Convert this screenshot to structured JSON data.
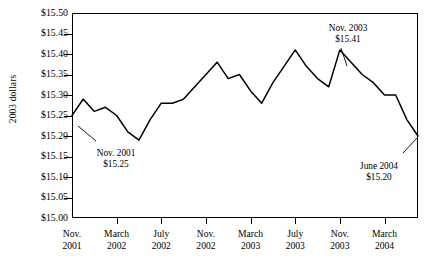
{
  "chart_data": {
    "type": "line",
    "title": "",
    "xlabel": "",
    "ylabel": "2003 dollars",
    "ylim": [
      15.0,
      15.5
    ],
    "ytick_step": 0.05,
    "grid": false,
    "legend": "none",
    "y_ticks": [
      "$15.50",
      "$15.45",
      "$15.40",
      "$15.35",
      "$15.30",
      "$15.25",
      "$15.20",
      "$15.15",
      "$15.10",
      "$15.05",
      "$15.00"
    ],
    "x_ticks": [
      {
        "line1": "Nov.",
        "line2": "2001"
      },
      {
        "line1": "March",
        "line2": "2002"
      },
      {
        "line1": "July",
        "line2": "2002"
      },
      {
        "line1": "Nov.",
        "line2": "2002"
      },
      {
        "line1": "March",
        "line2": "2003"
      },
      {
        "line1": "July",
        "line2": "2003"
      },
      {
        "line1": "Nov.",
        "line2": "2003"
      },
      {
        "line1": "March",
        "line2": "2004"
      }
    ],
    "x": [
      "Nov. 2001",
      "Dec. 2001",
      "Jan. 2002",
      "Feb. 2002",
      "March 2002",
      "April 2002",
      "May 2002",
      "June 2002",
      "July 2002",
      "Aug. 2002",
      "Sept. 2002",
      "Oct. 2002",
      "Nov. 2002",
      "Dec. 2002",
      "Jan. 2003",
      "Feb. 2003",
      "March 2003",
      "April 2003",
      "May 2003",
      "June 2003",
      "July 2003",
      "Aug. 2003",
      "Sept. 2003",
      "Oct. 2003",
      "Nov. 2003",
      "Dec. 2003",
      "Jan. 2004",
      "Feb. 2004",
      "March 2004",
      "April 2004",
      "May 2004",
      "June 2004"
    ],
    "values": [
      15.25,
      15.29,
      15.26,
      15.27,
      15.25,
      15.21,
      15.19,
      15.24,
      15.28,
      15.28,
      15.29,
      15.32,
      15.35,
      15.38,
      15.34,
      15.35,
      15.31,
      15.28,
      15.33,
      15.37,
      15.41,
      15.37,
      15.34,
      15.32,
      15.41,
      15.38,
      15.35,
      15.33,
      15.3,
      15.3,
      15.24,
      15.2
    ],
    "annotations": [
      {
        "name": "nov-2001",
        "label_line1": "Nov. 2001",
        "label_line2": "$15.25",
        "x": "Nov. 2001",
        "y": 15.25
      },
      {
        "name": "nov-2003",
        "label_line1": "Nov. 2003",
        "label_line2": "$15.41",
        "x": "Nov. 2003",
        "y": 15.41
      },
      {
        "name": "june-2004",
        "label_line1": "June 2004",
        "label_line2": "$15.20",
        "x": "June 2004",
        "y": 15.2
      }
    ],
    "colors": {
      "line": "#000000",
      "axis": "#000000",
      "background": "#ffffff"
    }
  }
}
